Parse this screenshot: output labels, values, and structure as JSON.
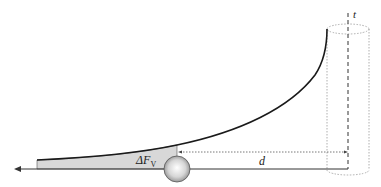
{
  "diagram": {
    "labels": {
      "axis_label": "t",
      "distance_label": "d",
      "force_label_main": "ΔF",
      "force_label_sub": "V"
    },
    "colors": {
      "curve": "#1a1a1a",
      "shaded_area": "#d8d8d8",
      "baseline": "#333333",
      "cylinder": "#9a9a9a",
      "sphere_light": "#ffffff",
      "sphere_dark": "#8a8a8a"
    }
  }
}
